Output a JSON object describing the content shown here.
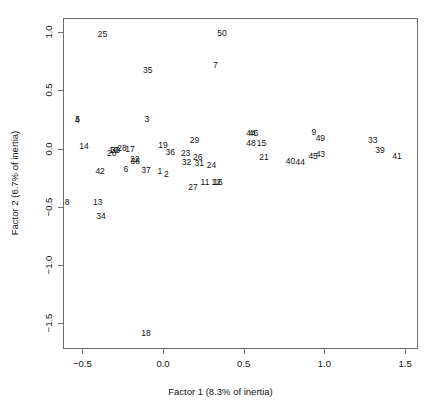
{
  "chart_data": {
    "type": "scatter",
    "title": "",
    "xlabel": "Factor 1 (8.3% of inertia)",
    "ylabel": "Factor 2 (6.7% of inertia)",
    "xlim": [
      -0.62,
      1.58
    ],
    "ylim": [
      -1.72,
      1.12
    ],
    "grid": false,
    "legend": "none",
    "marker_style": "text-labels-only",
    "xticks": [
      "-0.5",
      "0.0",
      "0.5",
      "1.0",
      "1.5"
    ],
    "xtick_values": [
      -0.5,
      0.0,
      0.5,
      1.0,
      1.5
    ],
    "yticks": [
      "1.0",
      "0.5",
      "0.0",
      "-0.5",
      "-1.0",
      "-1.5"
    ],
    "ytick_values": [
      1.0,
      0.5,
      0.0,
      -0.5,
      -1.0,
      -1.5
    ],
    "points": [
      {
        "label": "25",
        "x": -0.375,
        "y": 0.985
      },
      {
        "label": "50",
        "x": 0.365,
        "y": 0.99
      },
      {
        "label": "35",
        "x": -0.095,
        "y": 0.675
      },
      {
        "label": "7",
        "x": 0.325,
        "y": 0.72
      },
      {
        "label": "5",
        "x": -0.53,
        "y": 0.25
      },
      {
        "label": "4",
        "x": -0.533,
        "y": 0.248
      },
      {
        "label": "3",
        "x": -0.1,
        "y": 0.25
      },
      {
        "label": "9",
        "x": 0.935,
        "y": 0.14
      },
      {
        "label": "49",
        "x": 0.975,
        "y": 0.09
      },
      {
        "label": "46",
        "x": 0.56,
        "y": 0.135
      },
      {
        "label": "44",
        "x": 0.545,
        "y": 0.137
      },
      {
        "label": "33",
        "x": 1.3,
        "y": 0.075
      },
      {
        "label": "48",
        "x": 0.545,
        "y": 0.05
      },
      {
        "label": "15",
        "x": 0.61,
        "y": 0.048
      },
      {
        "label": "29",
        "x": 0.195,
        "y": 0.075
      },
      {
        "label": "14",
        "x": -0.49,
        "y": 0.02
      },
      {
        "label": "19",
        "x": 0.0,
        "y": 0.03
      },
      {
        "label": "39",
        "x": 1.345,
        "y": -0.01
      },
      {
        "label": "10",
        "x": -0.305,
        "y": -0.01
      },
      {
        "label": "30",
        "x": -0.295,
        "y": -0.012
      },
      {
        "label": "28",
        "x": -0.255,
        "y": 0.002
      },
      {
        "label": "17",
        "x": -0.205,
        "y": -0.005
      },
      {
        "label": "36",
        "x": 0.045,
        "y": -0.03
      },
      {
        "label": "23",
        "x": 0.14,
        "y": -0.035
      },
      {
        "label": "20",
        "x": -0.318,
        "y": -0.04
      },
      {
        "label": "41",
        "x": 1.45,
        "y": -0.065
      },
      {
        "label": "21",
        "x": 0.625,
        "y": -0.075
      },
      {
        "label": "45",
        "x": 0.93,
        "y": -0.06
      },
      {
        "label": "43",
        "x": 0.975,
        "y": -0.05
      },
      {
        "label": "26",
        "x": 0.215,
        "y": -0.075
      },
      {
        "label": "22",
        "x": -0.175,
        "y": -0.09
      },
      {
        "label": "38",
        "x": -0.172,
        "y": -0.11
      },
      {
        "label": "32",
        "x": 0.145,
        "y": -0.115
      },
      {
        "label": "31",
        "x": 0.225,
        "y": -0.12
      },
      {
        "label": "40",
        "x": 0.79,
        "y": -0.11
      },
      {
        "label": "44",
        "x": 0.85,
        "y": -0.115
      },
      {
        "label": "24",
        "x": 0.3,
        "y": -0.14
      },
      {
        "label": "6",
        "x": -0.23,
        "y": -0.175
      },
      {
        "label": "37",
        "x": -0.105,
        "y": -0.18
      },
      {
        "label": "1",
        "x": -0.02,
        "y": -0.19
      },
      {
        "label": "42",
        "x": -0.39,
        "y": -0.19
      },
      {
        "label": "2",
        "x": 0.02,
        "y": -0.215
      },
      {
        "label": "11",
        "x": 0.26,
        "y": -0.29
      },
      {
        "label": "12",
        "x": 0.33,
        "y": -0.285
      },
      {
        "label": "16",
        "x": 0.34,
        "y": -0.288
      },
      {
        "label": "27",
        "x": 0.185,
        "y": -0.33
      },
      {
        "label": "8",
        "x": -0.595,
        "y": -0.455
      },
      {
        "label": "13",
        "x": -0.405,
        "y": -0.455
      },
      {
        "label": "34",
        "x": -0.385,
        "y": -0.58
      },
      {
        "label": "18",
        "x": -0.105,
        "y": -1.585
      }
    ]
  }
}
